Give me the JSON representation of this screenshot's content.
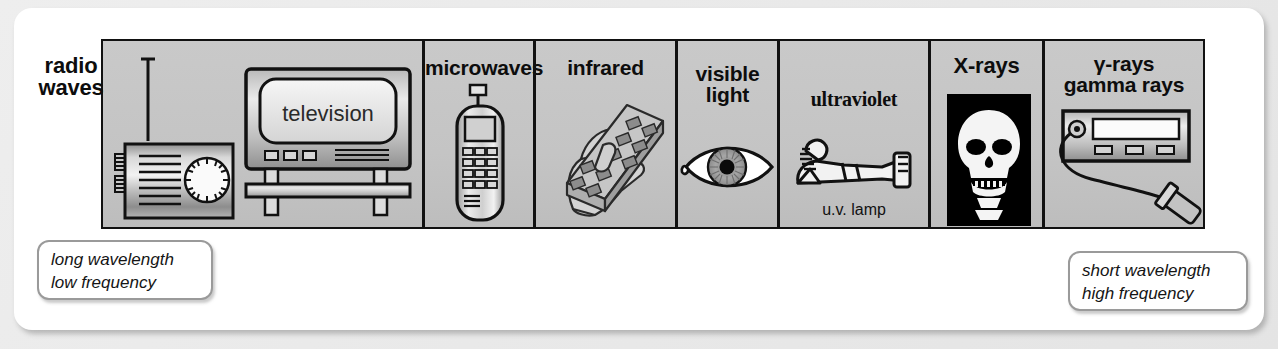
{
  "diagram": {
    "panel_background": "#c4c4c4",
    "border_color": "#111111",
    "bands": [
      {
        "id": "radio",
        "label_line1": "radio",
        "label_line2": "waves",
        "caption": "",
        "icons": [
          "radio-receiver-icon",
          "television-icon"
        ]
      },
      {
        "id": "microwaves",
        "label_line1": "microwaves",
        "label_line2": "",
        "caption": "",
        "icons": [
          "mobile-phone-icon"
        ]
      },
      {
        "id": "infrared",
        "label_line1": "infrared",
        "label_line2": "",
        "caption": "",
        "icons": [
          "hand-remote-control-icon"
        ]
      },
      {
        "id": "visible",
        "label_line1": "visible",
        "label_line2": "light",
        "caption": "",
        "icons": [
          "eye-icon"
        ]
      },
      {
        "id": "ultraviolet",
        "label_line1": "ultraviolet",
        "label_line2": "",
        "caption": "u.v. lamp",
        "icons": [
          "sunbather-icon"
        ]
      },
      {
        "id": "xrays",
        "label_line1": "X-rays",
        "label_line2": "",
        "caption": "",
        "icons": [
          "skull-xray-icon"
        ]
      },
      {
        "id": "gamma",
        "label_line1": "γ-rays",
        "label_line2": "gamma rays",
        "caption": "",
        "icons": [
          "geiger-counter-icon"
        ]
      }
    ],
    "screen_text": "television",
    "callout_left": {
      "line1": "long wavelength",
      "line2": "low frequency"
    },
    "callout_right": {
      "line1": "short wavelength",
      "line2": "high frequency"
    }
  }
}
